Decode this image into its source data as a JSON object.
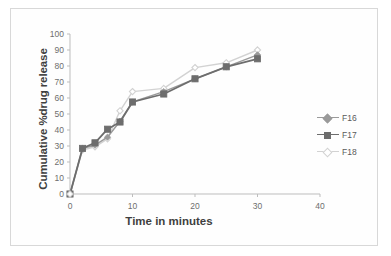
{
  "chart_data": {
    "type": "line",
    "title": "",
    "subtitle": "",
    "xlabel": "Time in minutes",
    "ylabel": "Cumulative %drug release",
    "xlim": [
      0,
      40
    ],
    "ylim": [
      0,
      100
    ],
    "xticks": [
      0,
      10,
      20,
      30,
      40
    ],
    "yticks": [
      0,
      10,
      20,
      30,
      40,
      50,
      60,
      70,
      80,
      90,
      100
    ],
    "grid": false,
    "legend_position": "right",
    "x": [
      0,
      2,
      4,
      6,
      8,
      10,
      15,
      20,
      25,
      30
    ],
    "series": [
      {
        "name": "F16",
        "marker": "diamond",
        "color": "#9a9a9a",
        "values": [
          0,
          28.5,
          30.5,
          35.5,
          45.5,
          57.5,
          64.0,
          72.0,
          79.5,
          87.0
        ]
      },
      {
        "name": "F17",
        "marker": "square",
        "color": "#6d6d6d",
        "values": [
          0,
          28.5,
          32.0,
          40.5,
          45.0,
          57.5,
          62.5,
          72.0,
          79.5,
          84.5
        ]
      },
      {
        "name": "F18",
        "marker": "diamond-open",
        "color": "#d2d2d2",
        "values": [
          0,
          27.5,
          29.5,
          34.5,
          52.0,
          64.0,
          66.0,
          79.0,
          82.0,
          90.0
        ]
      }
    ]
  },
  "axes": {
    "y_tick_labels": [
      "100",
      "90",
      "80",
      "70",
      "60",
      "50",
      "40",
      "30",
      "20",
      "10",
      "0"
    ],
    "x_tick_labels": [
      "0",
      "10",
      "20",
      "30",
      "40"
    ],
    "y_axis_title": "Cumulative %drug release",
    "x_axis_title": "Time in minutes"
  },
  "legend": {
    "items": [
      {
        "label": "F16"
      },
      {
        "label": "F17"
      },
      {
        "label": "F18"
      }
    ]
  },
  "colors": {
    "series_f16": "#9a9a9a",
    "series_f17": "#6d6d6d",
    "series_f18": "#d2d2d2",
    "axis": "#bdbdbd",
    "text": "#3f3f3f",
    "tick_text": "#6e6e6e",
    "frame": "#d8d8d8",
    "background": "#fefefe"
  }
}
